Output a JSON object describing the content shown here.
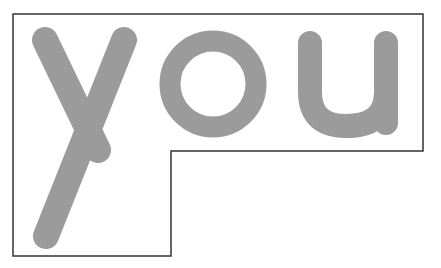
{
  "word": {
    "text": "you",
    "letters": [
      "y",
      "o",
      "u"
    ]
  },
  "colors": {
    "background": "#ffffff",
    "letter_fill": "#9b9b9b",
    "outline_stroke": "#333333"
  },
  "outline": {
    "shape": "step-polygon",
    "points": "13,14 423,14 423,151 171,151 171,256 13,256"
  }
}
